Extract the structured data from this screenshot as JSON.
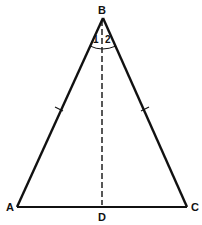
{
  "diagram": {
    "type": "isosceles-triangle",
    "colors": {
      "stroke": "#111111",
      "background": "#ffffff"
    },
    "vertices": {
      "A": {
        "label": "A",
        "x": 17,
        "y": 207
      },
      "B": {
        "label": "B",
        "x": 103,
        "y": 18
      },
      "C": {
        "label": "C",
        "x": 187,
        "y": 207
      },
      "D": {
        "label": "D",
        "x": 102,
        "y": 207
      }
    },
    "segments": [
      {
        "from": "A",
        "to": "B",
        "style": "solid",
        "tick_marks": 1
      },
      {
        "from": "B",
        "to": "C",
        "style": "solid",
        "tick_marks": 1
      },
      {
        "from": "A",
        "to": "C",
        "style": "solid",
        "tick_marks": 0
      },
      {
        "from": "B",
        "to": "D",
        "style": "dashed",
        "tick_marks": 0
      }
    ],
    "angles": [
      {
        "label": "1",
        "vertex": "B",
        "position": "left of BD"
      },
      {
        "label": "2",
        "vertex": "B",
        "position": "right of BD"
      }
    ]
  }
}
